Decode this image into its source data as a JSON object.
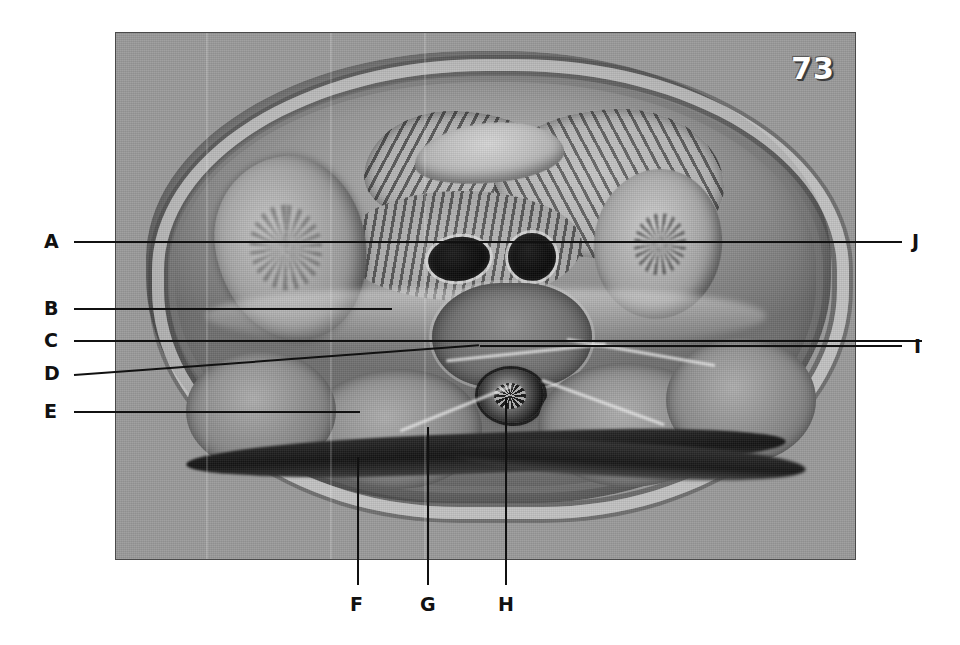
{
  "figure": {
    "page_number": "73",
    "plate_caption": "",
    "description_alt": "Transverse anatomical cross-section of the abdomen at mid-lumbar level with ten lettered leader lines"
  },
  "labels": {
    "left": [
      {
        "id": "A",
        "text": "A"
      },
      {
        "id": "B",
        "text": "B"
      },
      {
        "id": "C",
        "text": "C"
      },
      {
        "id": "D",
        "text": "D"
      },
      {
        "id": "E",
        "text": "E"
      }
    ],
    "right": [
      {
        "id": "J",
        "text": "J"
      },
      {
        "id": "I",
        "text": "I"
      }
    ],
    "bottom": [
      {
        "id": "F",
        "text": "F"
      },
      {
        "id": "G",
        "text": "G"
      },
      {
        "id": "H",
        "text": "H"
      }
    ]
  },
  "colors": {
    "plate_background": "#9a9a9a",
    "page_background": "#ffffff",
    "leader_line": "#111111",
    "label_text": "#111111",
    "page_number_text": "#ffffff",
    "page_number_shadow": "#3c3c3c",
    "plate_border": "#4a4a4a"
  }
}
